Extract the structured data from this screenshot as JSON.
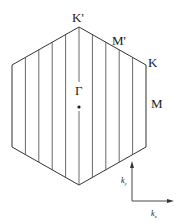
{
  "diagram": {
    "type": "brillouin-zone-hexagon",
    "colors": {
      "line": "#333333",
      "text": "#1a1a1a",
      "background": "#ffffff"
    },
    "points": {
      "K_prime": {
        "label": "K'"
      },
      "M_prime": {
        "label": "M'"
      },
      "K": {
        "label": "K"
      },
      "M": {
        "label": "M"
      },
      "Gamma": {
        "label": "Γ"
      }
    },
    "axes": {
      "ky": {
        "base": "k",
        "sub": "y"
      },
      "kx": {
        "base": "k",
        "sub": "x"
      }
    },
    "cut_lines_count": 9
  }
}
